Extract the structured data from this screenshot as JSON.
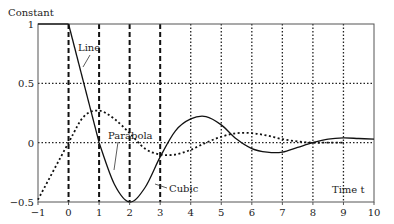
{
  "chart_data": {
    "type": "line",
    "title": "",
    "ylabel": "Constant",
    "xlabel": "Time t",
    "xlim": [
      -1,
      10
    ],
    "ylim": [
      -0.5,
      1
    ],
    "x_ticks": [
      "-1",
      "0",
      "1",
      "2",
      "3",
      "4",
      "5",
      "6",
      "7",
      "8",
      "9",
      "10"
    ],
    "y_ticks": [
      "1",
      "0.5",
      "0",
      "-0.5"
    ],
    "grid": {
      "vertical_dashed_at": [
        0,
        1,
        2,
        3
      ],
      "vertical_dotted_at": [
        4,
        5,
        6,
        7,
        8,
        9
      ],
      "horizontal_dotted_at": [
        0.5,
        0
      ]
    },
    "annotations": [
      "Line",
      "Parabola",
      "Cubic",
      "Time t"
    ],
    "series": [
      {
        "name": "Constant",
        "style": "solid",
        "x": [
          -1,
          0
        ],
        "y": [
          1,
          1
        ]
      },
      {
        "name": "Line",
        "style": "solid",
        "x": [
          0,
          1
        ],
        "y": [
          1,
          0
        ]
      },
      {
        "name": "Parabola",
        "style": "dotted",
        "x": [
          -1,
          0,
          0.5,
          1,
          1.5,
          2,
          2.5,
          3,
          3.5,
          4,
          4.5,
          5,
          5.5,
          6,
          6.5,
          7,
          7.5,
          8,
          8.5,
          9
        ],
        "y": [
          -0.48,
          0,
          0.22,
          0.27,
          0.2,
          0.08,
          -0.05,
          -0.1,
          -0.1,
          -0.06,
          0,
          0.05,
          0.08,
          0.08,
          0.06,
          0.03,
          0.01,
          0,
          0,
          0
        ]
      },
      {
        "name": "Cubic",
        "style": "solid",
        "x": [
          1,
          1.5,
          2,
          2.5,
          3,
          3.5,
          4,
          4.5,
          5,
          5.5,
          6,
          6.5,
          7,
          7.5,
          8,
          8.5,
          9,
          9.5,
          10
        ],
        "y": [
          0,
          -0.35,
          -0.5,
          -0.38,
          -0.12,
          0.1,
          0.2,
          0.22,
          0.15,
          0.03,
          -0.05,
          -0.08,
          -0.08,
          -0.04,
          0,
          0.03,
          0.04,
          0.035,
          0.03
        ]
      }
    ]
  }
}
